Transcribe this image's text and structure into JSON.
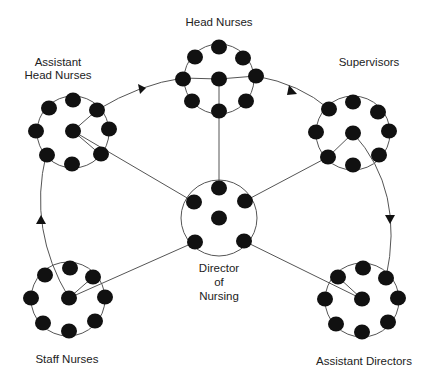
{
  "diagram": {
    "type": "organizational communication network",
    "colors": {
      "background": "#ffffff",
      "node": "#111111",
      "line": "#555555",
      "text": "#222222"
    },
    "groups": [
      {
        "id": "head-nurses",
        "label_lines": [
          "Head Nurses"
        ],
        "center": [
          219,
          79
        ],
        "ring_radius": 36,
        "nodes": [
          [
            219,
            47
          ],
          [
            195,
            56
          ],
          [
            243,
            58
          ],
          [
            183,
            78
          ],
          [
            256,
            76
          ],
          [
            192,
            101
          ],
          [
            246,
            101
          ],
          [
            219,
            111
          ],
          [
            219,
            79
          ]
        ]
      },
      {
        "id": "assistant-head-nurses",
        "label_lines": [
          "Assistant",
          "Head Nurses"
        ],
        "center": [
          73,
          131
        ],
        "ring_radius": 38,
        "nodes": [
          [
            49,
            108
          ],
          [
            73,
            100
          ],
          [
            97,
            110
          ],
          [
            36,
            131
          ],
          [
            109,
            129
          ],
          [
            46,
            155
          ],
          [
            72,
            164
          ],
          [
            101,
            155
          ],
          [
            73,
            131
          ]
        ]
      },
      {
        "id": "supervisors",
        "label_lines": [
          "Supervisors"
        ],
        "center": [
          353,
          133
        ],
        "ring_radius": 38,
        "nodes": [
          [
            329,
            109
          ],
          [
            353,
            102
          ],
          [
            378,
            112
          ],
          [
            316,
            132
          ],
          [
            389,
            131
          ],
          [
            328,
            157
          ],
          [
            353,
            165
          ],
          [
            379,
            156
          ],
          [
            353,
            133
          ]
        ]
      },
      {
        "id": "director-of-nursing",
        "label_lines": [
          "Director",
          "of",
          "Nursing"
        ],
        "center": [
          219,
          218
        ],
        "ring_radius": 39,
        "nodes": [
          [
            219,
            188
          ],
          [
            194,
            202
          ],
          [
            245,
            201
          ],
          [
            195,
            242
          ],
          [
            244,
            241
          ],
          [
            219,
            218
          ]
        ]
      },
      {
        "id": "staff-nurses",
        "label_lines": [
          "Staff Nurses"
        ],
        "center": [
          69,
          298
        ],
        "ring_radius": 40,
        "nodes": [
          [
            70,
            268
          ],
          [
            45,
            275
          ],
          [
            93,
            277
          ],
          [
            31,
            298
          ],
          [
            105,
            297
          ],
          [
            43,
            323
          ],
          [
            69,
            331
          ],
          [
            95,
            321
          ],
          [
            69,
            298
          ]
        ]
      },
      {
        "id": "assistant-directors",
        "label_lines": [
          "Assistant Directors"
        ],
        "center": [
          362,
          299
        ],
        "ring_radius": 40,
        "nodes": [
          [
            363,
            268
          ],
          [
            338,
            277
          ],
          [
            386,
            278
          ],
          [
            325,
            299
          ],
          [
            398,
            298
          ],
          [
            336,
            324
          ],
          [
            362,
            332
          ],
          [
            388,
            322
          ],
          [
            362,
            299
          ]
        ]
      }
    ],
    "connections": [
      {
        "from": "assistant-head-nurses",
        "to": "head-nurses",
        "directed": true,
        "style": "arc"
      },
      {
        "from": "head-nurses",
        "to": "supervisors",
        "directed": true,
        "style": "arc"
      },
      {
        "from": "supervisors",
        "to": "assistant-directors",
        "directed": true,
        "style": "arc"
      },
      {
        "from": "staff-nurses",
        "to": "assistant-head-nurses",
        "directed": true,
        "style": "arc"
      },
      {
        "from": "director-of-nursing",
        "to": "head-nurses",
        "directed": false,
        "style": "spoke"
      },
      {
        "from": "director-of-nursing",
        "to": "assistant-head-nurses",
        "directed": false,
        "style": "spoke"
      },
      {
        "from": "director-of-nursing",
        "to": "supervisors",
        "directed": false,
        "style": "spoke"
      },
      {
        "from": "director-of-nursing",
        "to": "staff-nurses",
        "directed": false,
        "style": "spoke"
      },
      {
        "from": "director-of-nursing",
        "to": "assistant-directors",
        "directed": false,
        "style": "spoke"
      }
    ],
    "labels": {
      "head_nurses": "Head Nurses",
      "assistant_head_nurses_1": "Assistant",
      "assistant_head_nurses_2": "Head Nurses",
      "supervisors": "Supervisors",
      "director_1": "Director",
      "director_2": "of",
      "director_3": "Nursing",
      "staff_nurses": "Staff Nurses",
      "assistant_directors": "Assistant Directors"
    }
  }
}
